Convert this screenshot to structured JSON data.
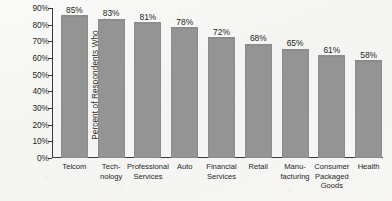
{
  "chart_data": {
    "type": "bar",
    "title": "",
    "xlabel": "",
    "ylabel": "Percent of Respondents Who Restructured Marketing Department",
    "ylabel_lines": [
      "Percent of Respondents Who",
      "Restructured Marketing Department"
    ],
    "categories": [
      "Telcom",
      "Technology",
      "Professional Services",
      "Auto",
      "Financial Services",
      "Retail",
      "Manufacturing",
      "Consumer Packaged Goods",
      "Health"
    ],
    "category_label_lines": [
      [
        "Telcom"
      ],
      [
        "Tech-",
        "nology"
      ],
      [
        "Professional",
        "Services"
      ],
      [
        "Auto"
      ],
      [
        "Financial",
        "Services"
      ],
      [
        "Retail"
      ],
      [
        "Manu-",
        "facturing"
      ],
      [
        "Consumer",
        "Packaged",
        "Goods"
      ],
      [
        "Health"
      ]
    ],
    "values": [
      85,
      83,
      81,
      78,
      72,
      68,
      65,
      61,
      58
    ],
    "value_labels": [
      "85%",
      "83%",
      "81%",
      "78%",
      "72%",
      "68%",
      "65%",
      "61%",
      "58%"
    ],
    "ylim": [
      0,
      90
    ],
    "ytick_values": [
      0,
      10,
      20,
      30,
      40,
      50,
      60,
      70,
      80,
      90
    ],
    "ytick_labels": [
      "0%",
      "10%",
      "20%",
      "30%",
      "40%",
      "50%",
      "60%",
      "70%",
      "80%",
      "90%"
    ],
    "grid": false,
    "legend": false,
    "legend_position": "none",
    "bar_color": "#949494",
    "axis_color": "#3a3a3a",
    "text_color": "#1f1f1f",
    "background_color": "#f7f7f6"
  }
}
